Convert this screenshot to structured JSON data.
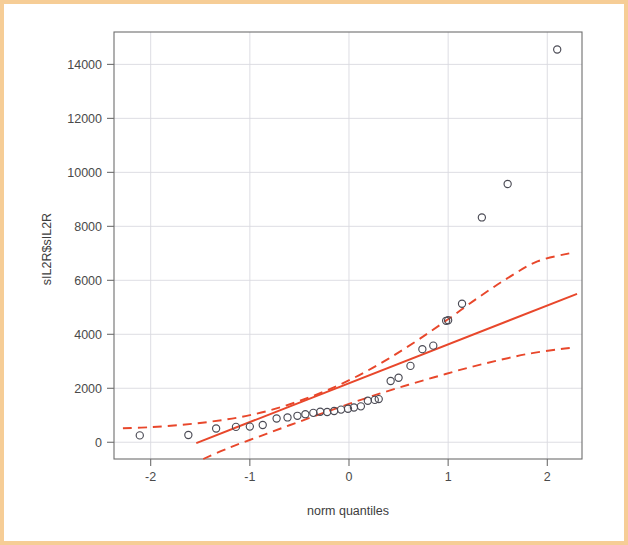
{
  "figure": {
    "border_color": "#f6cd96",
    "background": "#ffffff"
  },
  "axis_titles": {
    "x": "norm quantiles",
    "y": "sIL2R$sIL2R"
  },
  "chart_data": {
    "type": "scatter",
    "title": "",
    "subtitle": "",
    "xlabel": "norm quantiles",
    "ylabel": "sIL2R$sIL2R",
    "xlim": [
      -2.37,
      2.35
    ],
    "ylim": [
      -620,
      15200
    ],
    "xticks": [
      -2,
      -1,
      0,
      1,
      2
    ],
    "xtick_labels": [
      "-2",
      "-1",
      "0",
      "1",
      "2"
    ],
    "yticks": [
      0,
      2000,
      4000,
      6000,
      8000,
      10000,
      12000,
      14000
    ],
    "ytick_labels": [
      "0",
      "2000",
      "4000",
      "6000",
      "8000",
      "10000",
      "12000",
      "14000"
    ],
    "grid": true,
    "legend": null,
    "point_marker": "open-circle",
    "point_color": "#4b4b55",
    "line_color": "#e8472b",
    "series": [
      {
        "name": "sample quantiles",
        "x": [
          -2.11,
          -1.62,
          -1.34,
          -1.14,
          -1.0,
          -0.87,
          -0.73,
          -0.62,
          -0.52,
          -0.44,
          -0.36,
          -0.29,
          -0.22,
          -0.15,
          -0.08,
          -0.01,
          0.05,
          0.12,
          0.19,
          0.26,
          0.3,
          0.42,
          0.5,
          0.62,
          0.74,
          0.85,
          0.98,
          1.0,
          1.14,
          1.34,
          1.6,
          2.1
        ],
        "y": [
          255,
          270,
          510,
          570,
          580,
          640,
          880,
          920,
          980,
          1040,
          1090,
          1130,
          1120,
          1160,
          1210,
          1240,
          1290,
          1330,
          1540,
          1570,
          1600,
          2270,
          2390,
          2830,
          3450,
          3580,
          4500,
          4520,
          5130,
          8330,
          9570,
          14550
        ]
      }
    ],
    "reference_line": {
      "name": "qq robust fit line",
      "style": "solid",
      "color": "#e8472b",
      "x": [
        -1.54,
        2.3
      ],
      "y": [
        -30,
        5500
      ],
      "slope": 1436,
      "intercept": 2180
    },
    "envelope": {
      "name": "pointwise confidence envelope",
      "style": "dashed",
      "color": "#e8472b",
      "upper": {
        "x": [
          -2.28,
          -2.0,
          -1.7,
          -1.4,
          -1.1,
          -0.8,
          -0.5,
          -0.2,
          0.1,
          0.4,
          0.7,
          1.0,
          1.3,
          1.6,
          1.9,
          2.25
        ],
        "y": [
          520,
          560,
          640,
          760,
          930,
          1180,
          1530,
          1960,
          2480,
          3100,
          3800,
          4560,
          5350,
          6080,
          6700,
          7020
        ]
      },
      "lower": {
        "x": [
          -1.47,
          -1.2,
          -0.9,
          -0.6,
          -0.3,
          0.0,
          0.3,
          0.6,
          0.9,
          1.2,
          1.5,
          1.8,
          2.1,
          2.25
        ],
        "y": [
          -620,
          -190,
          220,
          630,
          1030,
          1420,
          1790,
          2130,
          2450,
          2760,
          3030,
          3270,
          3440,
          3500
        ]
      }
    }
  }
}
